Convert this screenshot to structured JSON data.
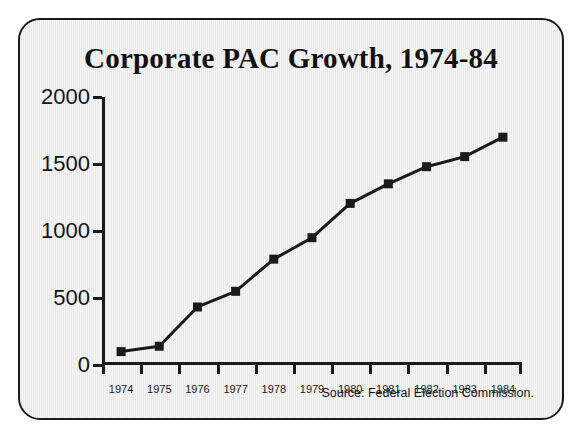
{
  "figure": {
    "title": "Corporate PAC Growth, 1974-84",
    "source_note": "Source: Federal Election Commission.",
    "frame_color": "#1a1a1a",
    "background_color": "#ececed",
    "ink_color": "#1a1a1a"
  },
  "chart_data": {
    "type": "line",
    "title": "Corporate PAC Growth, 1974-84",
    "xlabel": "",
    "ylabel": "",
    "categories": [
      "1974",
      "1975",
      "1976",
      "1977",
      "1978",
      "1979",
      "1980",
      "1981",
      "1982",
      "1983",
      "1984"
    ],
    "values": [
      100,
      140,
      433,
      550,
      790,
      950,
      1206,
      1352,
      1480,
      1555,
      1700
    ],
    "series": [
      {
        "name": "Corporate PACs",
        "values": [
          100,
          140,
          433,
          550,
          790,
          950,
          1206,
          1352,
          1480,
          1555,
          1700
        ],
        "line_color": "#1a1a1a",
        "marker": "square",
        "marker_color": "#1a1a1a"
      }
    ],
    "ylim": [
      0,
      2000
    ],
    "yticks": [
      0,
      500,
      1000,
      1500,
      2000
    ],
    "ytick_labels": [
      "0",
      "500",
      "1000",
      "1500",
      "2000"
    ],
    "xtick_style": "between-labels",
    "grid": false,
    "legend": false,
    "annotations": [
      "Source: Federal Election Commission."
    ]
  }
}
